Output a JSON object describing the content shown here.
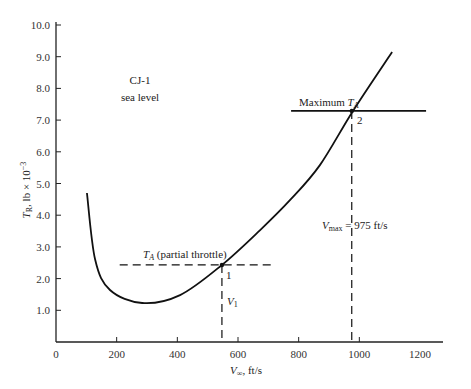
{
  "chart_data": {
    "type": "line",
    "title": "",
    "xlabel": "V∞, ft/s",
    "ylabel": "T_R, lb × 10⁻³",
    "xlim": [
      0,
      1200
    ],
    "ylim": [
      0,
      10
    ],
    "x_ticks": [
      "0",
      "200",
      "400",
      "600",
      "800",
      "1000",
      "1200"
    ],
    "y_ticks": [
      "1.0",
      "2.0",
      "3.0",
      "4.0",
      "5.0",
      "6.0",
      "7.0",
      "8.0",
      "9.0",
      "10.0"
    ],
    "grid": false,
    "series": [
      {
        "name": "Thrust required (T_R)",
        "style": "solid",
        "x": [
          102,
          129,
          178,
          284,
          409,
          547,
          673,
          772,
          870,
          979,
          1108
        ],
        "y": [
          4.7,
          2.6,
          1.64,
          1.23,
          1.48,
          2.43,
          3.53,
          4.48,
          5.58,
          7.29,
          9.15
        ]
      },
      {
        "name": "Maximum T_A",
        "style": "solid-horizontal",
        "x": [
          775,
          1220
        ],
        "y": [
          7.29,
          7.29
        ]
      },
      {
        "name": "T_A (partial throttle)",
        "style": "dashed-horizontal",
        "x": [
          210,
          720
        ],
        "y": [
          2.43,
          2.43
        ]
      }
    ],
    "points": [
      {
        "label": "1",
        "x": 547,
        "y": 2.43
      },
      {
        "label": "2",
        "x": 975,
        "y": 7.29
      }
    ],
    "annotations": [
      {
        "text": "CJ-1",
        "x": 270,
        "y": 8.2
      },
      {
        "text": "sea level",
        "x": 270,
        "y": 7.7
      },
      {
        "text": "Maximum T_A",
        "x": 780,
        "y": 7.7
      },
      {
        "text": "T_A (partial throttle)",
        "x": 290,
        "y": 2.8
      },
      {
        "text": "V_1",
        "x": 555,
        "y": 1.3
      },
      {
        "text": "V_max = 975 ft/s",
        "x": 870,
        "y": 3.7
      }
    ]
  },
  "labels": {
    "x_axis": "V∞, ft/s",
    "x_axis_var": "V",
    "x_axis_sub": "∞",
    "x_axis_unit": ", ft/s",
    "y_axis_var": "T",
    "y_axis_sub": "R",
    "y_axis_unit": ", lb × 10",
    "y_axis_exp": "−3",
    "aircraft": "CJ-1",
    "altitude": "sea level",
    "max_ta_prefix": "Maximum ",
    "ta_var": "T",
    "ta_sub": "A",
    "partial_suffix": " (partial throttle)",
    "point1": "1",
    "point2": "2",
    "v1_var": "V",
    "v1_sub": "1",
    "vmax_var": "V",
    "vmax_sub": "max",
    "vmax_value": " = 975 ft/s"
  }
}
